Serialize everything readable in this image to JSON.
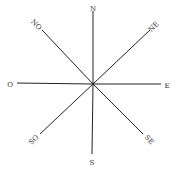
{
  "diagram": {
    "type": "compass-rose",
    "center": {
      "x": 93,
      "y": 84
    },
    "line_color": "#222222",
    "label_color": "#333333",
    "directions": [
      {
        "key": "N",
        "label": "N",
        "x1": 93,
        "y1": 84,
        "x2": 93,
        "y2": 11,
        "lx": 93,
        "ly": 9,
        "rot": 0
      },
      {
        "key": "NE",
        "label": "NE",
        "x1": 93,
        "y1": 84,
        "x2": 150,
        "y2": 30,
        "lx": 154,
        "ly": 27,
        "rot": -45
      },
      {
        "key": "E",
        "label": "E",
        "x1": 93,
        "y1": 84,
        "x2": 161,
        "y2": 84,
        "lx": 167,
        "ly": 86,
        "rot": 0
      },
      {
        "key": "SE",
        "label": "SE",
        "x1": 93,
        "y1": 84,
        "x2": 143,
        "y2": 134,
        "lx": 149,
        "ly": 140,
        "rot": 45
      },
      {
        "key": "S",
        "label": "S",
        "x1": 93,
        "y1": 84,
        "x2": 92,
        "y2": 154,
        "lx": 92,
        "ly": 163,
        "rot": 0
      },
      {
        "key": "SO",
        "label": "SO",
        "x1": 93,
        "y1": 84,
        "x2": 40,
        "y2": 134,
        "lx": 34,
        "ly": 140,
        "rot": -45
      },
      {
        "key": "O",
        "label": "O",
        "x1": 93,
        "y1": 84,
        "x2": 17,
        "y2": 83,
        "lx": 10,
        "ly": 85,
        "rot": 0
      },
      {
        "key": "NO",
        "label": "NO",
        "x1": 93,
        "y1": 84,
        "x2": 42,
        "y2": 30,
        "lx": 36,
        "ly": 25,
        "rot": 45
      }
    ]
  }
}
